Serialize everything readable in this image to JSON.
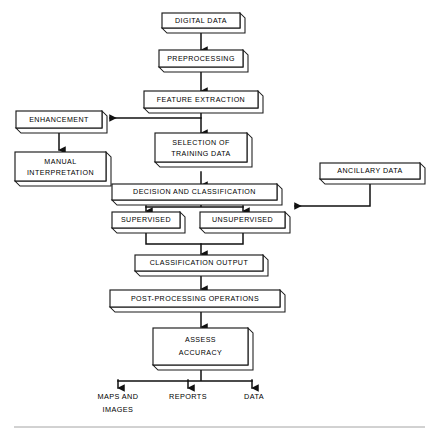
{
  "diagram": {
    "nodes": {
      "digital_data": "DIGITAL DATA",
      "preprocessing": "PREPROCESSING",
      "feature_extraction": "FEATURE EXTRACTION",
      "enhancement": "ENHANCEMENT",
      "manual_interpretation_line1": "MANUAL",
      "manual_interpretation_line2": "INTERPRETATION",
      "selection_line1": "SELECTION OF",
      "selection_line2": "TRAINING DATA",
      "decision_classification": "DECISION AND CLASSIFICATION",
      "ancillary_data": "ANCILLARY DATA",
      "supervised": "SUPERVISED",
      "unsupervised": "UNSUPERVISED",
      "classification_output": "CLASSIFICATION OUTPUT",
      "post_processing": "POST-PROCESSING OPERATIONS",
      "assess_line1": "ASSESS",
      "assess_line2": "ACCURACY"
    },
    "terminals": {
      "maps_line1": "MAPS AND",
      "maps_line2": "IMAGES",
      "reports": "REPORTS",
      "data": "DATA"
    },
    "colors": {
      "background": "#ffffff",
      "box_fill": "#ffffff",
      "stroke": "#1a1a1a",
      "connector": "#111111"
    }
  }
}
